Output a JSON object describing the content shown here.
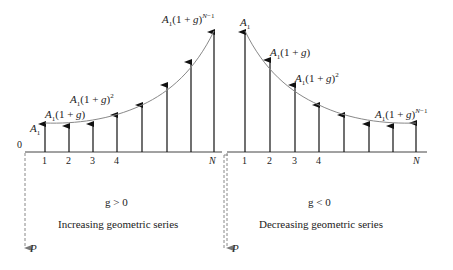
{
  "left_panel": {
    "origin_label": "0",
    "tick_labels": [
      "1",
      "2",
      "3",
      "4",
      "N"
    ],
    "value_labels": {
      "first": "A1",
      "second": "A1(1 + g)",
      "third": "A1(1 + g)^2",
      "last": "A1(1 + g)^(N-1)"
    },
    "condition": "g > 0",
    "caption": "Increasing geometric series",
    "present_worth_label": "P",
    "arrow_heights_px": [
      29,
      26,
      28,
      37,
      47,
      67,
      90,
      120
    ]
  },
  "right_panel": {
    "tick_labels": [
      "1",
      "2",
      "3",
      "4",
      "N"
    ],
    "value_labels": {
      "first": "A1",
      "second": "A1(1 + g)",
      "third": "A1(1 + g)^2",
      "last": "A1(1 + g)^(N-1)"
    },
    "condition": "g < 0",
    "caption": "Decreasing geometric series",
    "present_worth_label": "P",
    "arrow_heights_px": [
      120,
      92,
      67,
      47,
      37,
      28,
      26,
      29
    ]
  }
}
